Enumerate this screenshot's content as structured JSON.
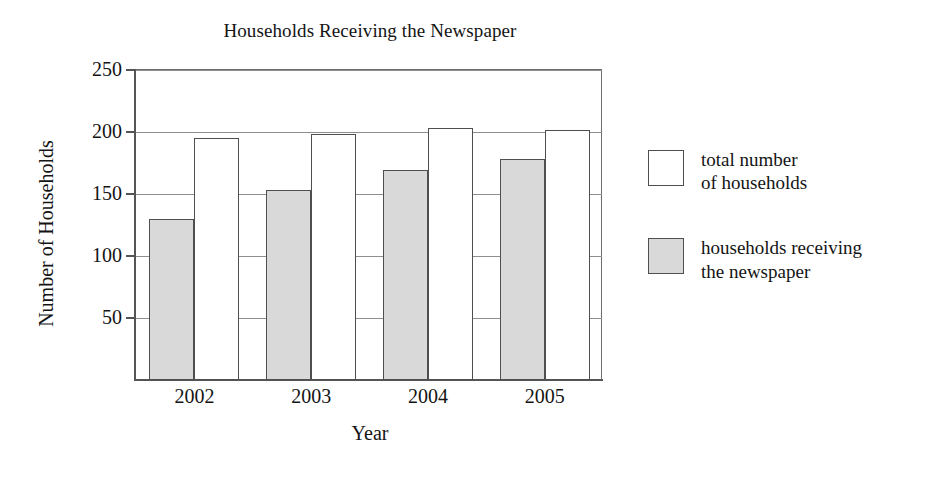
{
  "chart_data": {
    "type": "bar",
    "title": "Households Receiving the Newspaper",
    "xlabel": "Year",
    "ylabel": "Number of Households",
    "categories": [
      "2002",
      "2003",
      "2004",
      "2005"
    ],
    "ylim": [
      0,
      250
    ],
    "yticks": [
      50,
      100,
      150,
      200,
      250
    ],
    "ytick_labels": [
      "50",
      "100",
      "150",
      "200",
      "250"
    ],
    "grid": true,
    "legend_position": "right",
    "series": [
      {
        "name": "households receiving the newspaper",
        "legend_label_line1": "households receiving",
        "legend_label_line2": "the newspaper",
        "swatch": "shaded",
        "color": "#d9d9d9",
        "values": [
          130,
          153,
          169,
          178
        ]
      },
      {
        "name": "total number of households",
        "legend_label_line1": "total number",
        "legend_label_line2": "of households",
        "swatch": "open",
        "color": "#ffffff",
        "values": [
          195,
          198,
          203,
          202
        ]
      }
    ],
    "series_draw_order": [
      "households receiving the newspaper",
      "total number of households"
    ],
    "colors": {
      "shaded_fill": "#d9d9d9",
      "open_fill": "#ffffff",
      "bar_outline": "#4f4f4f",
      "gridline": "#8e8e8e",
      "axis": "#555555",
      "text": "#141414",
      "background": "#ffffff"
    }
  }
}
